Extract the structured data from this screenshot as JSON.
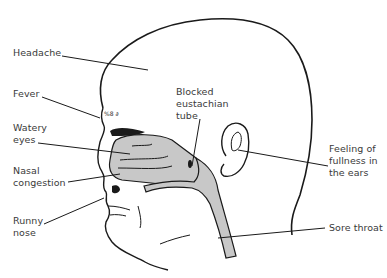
{
  "diagram": {
    "type": "annotated illustration",
    "colors": {
      "ink": "#1a1a1a",
      "label_text": "#3a3a3a",
      "shaded_airway": "#c8c8c8",
      "background": "#ffffff"
    },
    "labels": {
      "headache": "Headache",
      "fever": "Fever",
      "watery_eyes": "Watery\neyes",
      "nasal_congestion": "Nasal\ncongestion",
      "runny_nose": "Runny\nnose",
      "blocked_eustachian_tube": "Blocked\neustachian\ntube",
      "ear_fullness": "Feeling of\nfullness in\nthe ears",
      "sore_throat": "Sore throat"
    },
    "icon_names": {
      "head": "head-profile-outline",
      "ear": "ear-icon",
      "sinus": "nasal-cavity-shaded",
      "throat": "throat-airway-shaded",
      "fever_marks": "fever-heat-marks"
    }
  }
}
